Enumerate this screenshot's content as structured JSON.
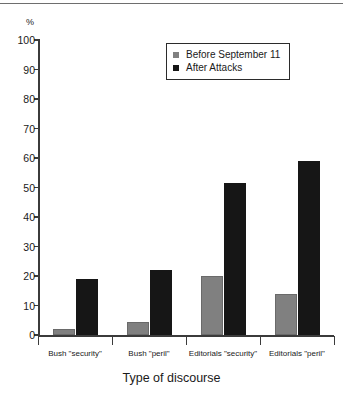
{
  "figure": {
    "unit_label": "%",
    "axis_title": "Type of discourse"
  },
  "legend": {
    "items": [
      {
        "label": "Before September 11",
        "color": "#808080",
        "swatch": "gray-square-icon"
      },
      {
        "label": "After Attacks",
        "color": "#161616",
        "swatch": "black-square-icon"
      }
    ]
  },
  "chart_data": {
    "type": "bar",
    "title": "",
    "xlabel": "Type of discourse",
    "ylabel": "%",
    "ylim": [
      0,
      100
    ],
    "yticks": [
      0,
      10,
      20,
      30,
      40,
      50,
      60,
      70,
      80,
      90,
      100
    ],
    "grid": false,
    "legend_position": "top-center",
    "categories": [
      "Bush \"security\"",
      "Bush \"peril\"",
      "Editorials  \"security\"",
      "Editorials \"peril\""
    ],
    "series": [
      {
        "name": "Before September 11",
        "color": "#808080",
        "values": [
          2,
          4.5,
          20,
          14
        ]
      },
      {
        "name": "After Attacks",
        "color": "#161616",
        "values": [
          19,
          22,
          51.5,
          59
        ]
      }
    ]
  }
}
